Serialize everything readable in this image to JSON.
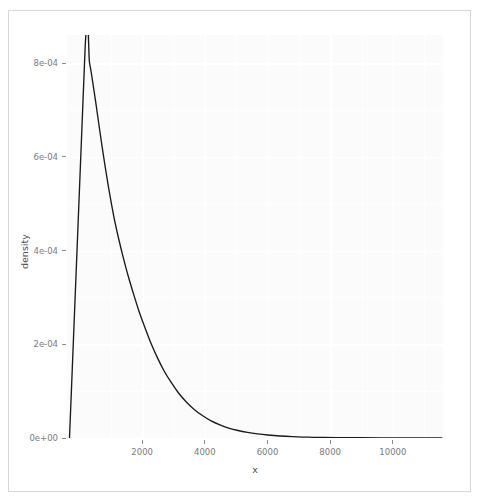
{
  "chart_data": {
    "type": "line",
    "title": "",
    "subtitle": "",
    "xlabel": "x",
    "ylabel": "density",
    "grid": true,
    "legend": null,
    "xlim": [
      -400,
      11600
    ],
    "ylim": [
      0,
      0.00086
    ],
    "x_ticks": [
      2000,
      4000,
      6000,
      8000,
      10000
    ],
    "x_tick_labels": [
      "2000",
      "4000",
      "6000",
      "8000",
      "10000"
    ],
    "y_ticks": [
      0,
      0.0002,
      0.0004,
      0.0006,
      0.0008
    ],
    "y_tick_labels": [
      "0e+00",
      "2e-04",
      "4e-04",
      "6e-04",
      "8e-04"
    ],
    "series": [
      {
        "name": "density",
        "color": "#1a1a1a",
        "x": [
          -320,
          -320,
          180,
          320,
          420,
          520,
          620,
          720,
          820,
          920,
          1020,
          1120,
          1260,
          1400,
          1560,
          1720,
          1900,
          2080,
          2280,
          2480,
          2700,
          2920,
          3160,
          3400,
          3660,
          3920,
          4200,
          4480,
          4760,
          5060,
          5360,
          5680,
          6000,
          6400,
          6800,
          7300,
          7800,
          8400,
          9000,
          9600,
          10200,
          10800,
          11400,
          11560
        ],
        "y": [
          0.0,
          0.0,
          0.000835,
          0.0008,
          0.00076,
          0.000715,
          0.000668,
          0.000622,
          0.000578,
          0.000537,
          0.000499,
          0.000464,
          0.000422,
          0.000384,
          0.000344,
          0.000308,
          0.00027,
          0.000237,
          0.000202,
          0.000172,
          0.000143,
          0.000119,
          9.6e-05,
          7.75e-05,
          6.1e-05,
          4.8e-05,
          3.65e-05,
          2.8e-05,
          2.13e-05,
          1.6e-05,
          1.2e-05,
          8.8e-06,
          6.4e-06,
          4.2e-06,
          2.8e-06,
          1.7e-06,
          1.1e-06,
          7e-07,
          5e-07,
          4e-07,
          3e-07,
          2e-07,
          2e-07,
          2e-07
        ]
      }
    ],
    "annotations": []
  },
  "axis": {
    "y_title": "density",
    "x_title": "x",
    "y_tick_labels": [
      "0e+00",
      "2e-04",
      "4e-04",
      "6e-04",
      "8e-04"
    ],
    "x_tick_labels": [
      "2000",
      "4000",
      "6000",
      "8000",
      "10000"
    ]
  },
  "colors": {
    "curve": "#1a1a1a",
    "panel_background": "#fbfbfb",
    "gridline": "#ffffff",
    "tick_label": "#7b7b7b",
    "axis_title": "#4d4d4d",
    "outer_border": "#d6d6d6"
  }
}
